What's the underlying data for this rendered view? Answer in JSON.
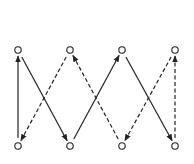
{
  "diagram": {
    "type": "directed-graph",
    "stroke_color": "#222222",
    "node_fill": "#ffffff",
    "nodes": [
      {
        "id": "T1",
        "row": "top",
        "x": 18,
        "y": 50
      },
      {
        "id": "T2",
        "row": "top",
        "x": 70,
        "y": 50
      },
      {
        "id": "T3",
        "row": "top",
        "x": 122,
        "y": 50
      },
      {
        "id": "T4",
        "row": "top",
        "x": 175,
        "y": 50
      },
      {
        "id": "B1",
        "row": "bottom",
        "x": 18,
        "y": 146
      },
      {
        "id": "B2",
        "row": "bottom",
        "x": 70,
        "y": 146
      },
      {
        "id": "B3",
        "row": "bottom",
        "x": 122,
        "y": 146
      },
      {
        "id": "B4",
        "row": "bottom",
        "x": 175,
        "y": 146
      }
    ],
    "edges": [
      {
        "from": "B1",
        "to": "T1",
        "style": "solid"
      },
      {
        "from": "T1",
        "to": "B2",
        "style": "solid"
      },
      {
        "from": "T2",
        "to": "B1",
        "style": "dashed"
      },
      {
        "from": "B3",
        "to": "T2",
        "style": "dashed"
      },
      {
        "from": "B2",
        "to": "T3",
        "style": "solid"
      },
      {
        "from": "T3",
        "to": "B4",
        "style": "solid"
      },
      {
        "from": "T4",
        "to": "B3",
        "style": "dashed"
      },
      {
        "from": "B4",
        "to": "T4",
        "style": "dashed"
      }
    ]
  }
}
